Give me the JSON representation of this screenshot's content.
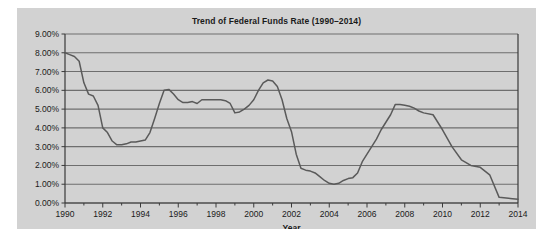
{
  "chart_data": {
    "type": "line",
    "title": "Trend of Federal Funds Rate (1990–2014)",
    "xlabel": "Year",
    "ylabel": "",
    "xlim": [
      1990,
      2014
    ],
    "ylim": [
      0,
      9
    ],
    "grid": true,
    "legend": null,
    "y_tick_labels": [
      "0.00%",
      "1.00%",
      "2.00%",
      "3.00%",
      "4.00%",
      "5.00%",
      "6.00%",
      "7.00%",
      "8.00%",
      "9.00%"
    ],
    "y_tick_values": [
      0,
      1,
      2,
      3,
      4,
      5,
      6,
      7,
      8,
      9
    ],
    "x_tick_labels": [
      "1990",
      "1992",
      "1994",
      "1996",
      "1998",
      "2000",
      "2002",
      "2004",
      "2006",
      "2008",
      "2010",
      "2012",
      "2014"
    ],
    "x_tick_values": [
      1990,
      1992,
      1994,
      1996,
      1998,
      2000,
      2002,
      2004,
      2006,
      2008,
      2010,
      2012,
      2014
    ],
    "x_minor_step": 1,
    "line_color": "#5a5a5a",
    "background_color": "#d2d2d2",
    "gridline_color": "#6e6e6e",
    "series": [
      {
        "name": "Federal Funds Rate",
        "x": [
          1990.0,
          1990.25,
          1990.5,
          1990.75,
          1991.0,
          1991.25,
          1991.5,
          1991.75,
          1992.0,
          1992.25,
          1992.5,
          1992.75,
          1993.0,
          1993.25,
          1993.5,
          1993.75,
          1994.0,
          1994.25,
          1994.5,
          1994.75,
          1995.0,
          1995.25,
          1995.5,
          1995.75,
          1996.0,
          1996.25,
          1996.5,
          1996.75,
          1997.0,
          1997.25,
          1997.5,
          1997.75,
          1998.0,
          1998.25,
          1998.5,
          1998.75,
          1999.0,
          1999.25,
          1999.5,
          1999.75,
          2000.0,
          2000.25,
          2000.5,
          2000.75,
          2001.0,
          2001.25,
          2001.5,
          2001.75,
          2002.0,
          2002.25,
          2002.5,
          2002.75,
          2003.0,
          2003.25,
          2003.5,
          2003.75,
          2004.0,
          2004.25,
          2004.5,
          2004.75,
          2005.0,
          2005.25,
          2005.5,
          2005.75,
          2006.0,
          2006.25,
          2006.5,
          2006.75,
          2007.0,
          2007.25,
          2007.5,
          2007.75,
          2008.0,
          2008.25,
          2008.5,
          2008.75,
          2009.0,
          2009.5,
          2010.0,
          2010.5,
          2011.0,
          2011.5,
          2012.0,
          2012.5,
          2013.0,
          2013.5,
          2014.0
        ],
        "y": [
          8.0,
          7.9,
          7.8,
          7.55,
          6.4,
          5.8,
          5.7,
          5.2,
          4.0,
          3.75,
          3.3,
          3.1,
          3.1,
          3.15,
          3.25,
          3.25,
          3.3,
          3.35,
          3.75,
          4.5,
          5.3,
          6.0,
          6.05,
          5.8,
          5.5,
          5.35,
          5.35,
          5.4,
          5.3,
          5.5,
          5.5,
          5.5,
          5.5,
          5.5,
          5.45,
          5.3,
          4.8,
          4.85,
          5.0,
          5.2,
          5.5,
          6.0,
          6.4,
          6.55,
          6.5,
          6.2,
          5.5,
          4.5,
          3.8,
          2.6,
          1.85,
          1.75,
          1.7,
          1.6,
          1.4,
          1.2,
          1.05,
          1.0,
          1.05,
          1.2,
          1.3,
          1.35,
          1.6,
          2.2,
          2.6,
          3.0,
          3.4,
          3.9,
          4.3,
          4.7,
          5.25,
          5.25,
          5.2,
          5.15,
          5.05,
          4.9,
          4.8,
          4.7,
          3.9,
          3.0,
          2.3,
          2.0,
          1.9,
          1.5,
          0.3,
          0.25,
          0.2
        ]
      }
    ],
    "annotations": [],
    "notes": {
      "start_value": "8.00%",
      "peak_2000": "6.55%",
      "trough_2003": "1.00%",
      "peak_2006": "5.25%",
      "end_value": "0.20%"
    }
  }
}
